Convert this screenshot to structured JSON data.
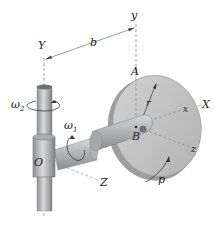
{
  "diagram": {
    "labels": {
      "y_small": "y",
      "Y": "Y",
      "b": "b",
      "A": "A",
      "r": "r",
      "x_small": "x",
      "X": "X",
      "B": "B",
      "z_small": "z",
      "Z": "Z",
      "O": "O",
      "p": "p",
      "omega1": "ω",
      "omega1_sub": "1",
      "omega2": "ω",
      "omega2_sub": "2"
    },
    "colors": {
      "metal": "#b9bbbd",
      "metal_dark": "#8e9092",
      "metal_light": "#d6d8d9",
      "disk_face": "#c4c4c4",
      "disk_rim": "#a8a8a8",
      "line": "#555555"
    }
  }
}
